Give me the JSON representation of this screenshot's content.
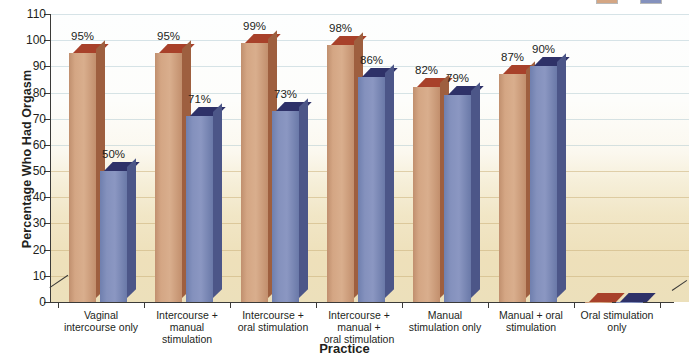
{
  "chart_data": {
    "type": "bar",
    "title": "",
    "xlabel": "Practice",
    "ylabel": "Percentage Who Had Orgasm",
    "ylim": [
      0,
      110
    ],
    "yticks": [
      0,
      10,
      20,
      30,
      40,
      50,
      60,
      70,
      80,
      90,
      100,
      110
    ],
    "ytick_labels": [
      "0",
      "10",
      "20",
      "30",
      "40",
      "50",
      "60",
      "70",
      "80",
      "90",
      "100",
      "110"
    ],
    "grid": true,
    "legend_position": "top-right",
    "categories": [
      "Vaginal\nintercourse only",
      "Intercourse +\nmanual\nstimulation",
      "Intercourse +\noral stimulation",
      "Intercourse +\nmanual +\noral stimulation",
      "Manual\nstimulation only",
      "Manual + oral\nstimulation",
      "Oral stimulation\nonly"
    ],
    "series": [
      {
        "name": "Men",
        "color": "#d4a684",
        "top_color": "#a8412a",
        "values": [
          95,
          95,
          99,
          98,
          82,
          87,
          0
        ],
        "value_labels": [
          "95%",
          "95%",
          "99%",
          "98%",
          "82%",
          "87%",
          ""
        ]
      },
      {
        "name": "Women",
        "color": "#8491bd",
        "top_color": "#2e3168",
        "values": [
          50,
          71,
          73,
          86,
          79,
          90,
          0
        ],
        "value_labels": [
          "50%",
          "71%",
          "73%",
          "86%",
          "79%",
          "90%",
          ""
        ]
      }
    ]
  },
  "axes": {
    "y_title": "Percentage Who Had Orgasm",
    "x_title": "Practice",
    "y_tick_labels": [
      "110",
      "100",
      "90",
      "80",
      "70",
      "60",
      "50",
      "40",
      "30",
      "20",
      "10",
      "0"
    ]
  },
  "categories": [
    {
      "lines": [
        "Vaginal",
        "intercourse only"
      ]
    },
    {
      "lines": [
        "Intercourse +",
        "manual",
        "stimulation"
      ]
    },
    {
      "lines": [
        "Intercourse +",
        "oral stimulation"
      ]
    },
    {
      "lines": [
        "Intercourse +",
        "manual +",
        "oral stimulation"
      ]
    },
    {
      "lines": [
        "Manual",
        "stimulation only"
      ]
    },
    {
      "lines": [
        "Manual + oral",
        "stimulation"
      ]
    },
    {
      "lines": [
        "Oral stimulation",
        "only"
      ]
    }
  ],
  "legend": {
    "items": [
      {
        "label": "",
        "color": "#d4a684"
      },
      {
        "label": "",
        "color": "#8491bd"
      }
    ]
  }
}
